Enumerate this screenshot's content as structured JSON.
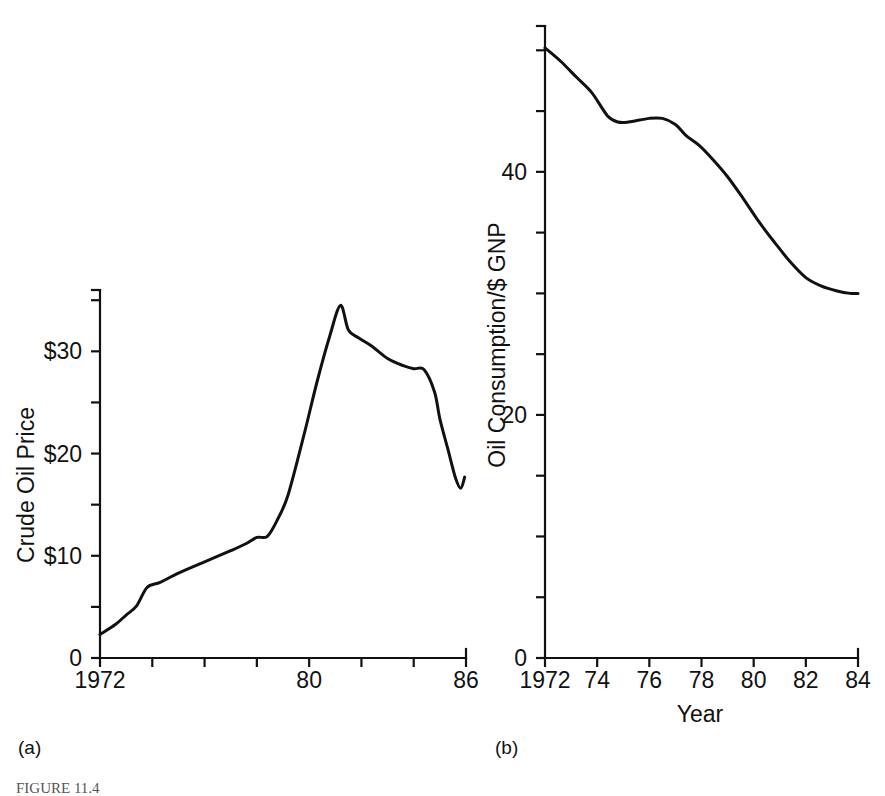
{
  "figure": {
    "caption": "FIGURE 11.4",
    "panel_a_label": "(a)",
    "panel_b_label": "(b)",
    "ink_color": "#111111",
    "background_color": "#ffffff"
  },
  "chart_data": [
    {
      "id": "panel-a",
      "type": "line",
      "title": "",
      "xlabel": "",
      "ylabel": "Crude Oil Price",
      "xlim": [
        1972,
        1986
      ],
      "ylim": [
        0,
        36
      ],
      "grid": false,
      "legend": null,
      "x_tick_values": [
        1972,
        1974,
        1976,
        1978,
        1980,
        1982,
        1984,
        1986
      ],
      "x_tick_labels": [
        "1972",
        "",
        "",
        "",
        "80",
        "",
        "",
        "86"
      ],
      "y_tick_values": [
        0,
        5,
        10,
        15,
        20,
        25,
        30,
        35
      ],
      "y_tick_labels": [
        "0",
        "",
        "$10",
        "",
        "$20",
        "",
        "$30",
        ""
      ],
      "series": [
        {
          "name": "Crude Oil Price",
          "x": [
            1972.0,
            1972.6,
            1973.0,
            1973.4,
            1973.8,
            1974.3,
            1975.0,
            1976.0,
            1977.0,
            1977.6,
            1978.0,
            1978.4,
            1978.8,
            1979.2,
            1979.8,
            1980.3,
            1980.8,
            1981.2,
            1981.5,
            1981.9,
            1982.4,
            1983.0,
            1983.6,
            1984.0,
            1984.4,
            1984.8,
            1985.0,
            1985.3,
            1985.6,
            1985.8,
            1985.95
          ],
          "y": [
            2.3,
            3.3,
            4.2,
            5.1,
            6.9,
            7.4,
            8.3,
            9.4,
            10.5,
            11.2,
            11.8,
            11.9,
            13.6,
            16.0,
            21.8,
            27.0,
            31.6,
            34.5,
            32.1,
            31.3,
            30.5,
            29.3,
            28.6,
            28.3,
            28.2,
            26.0,
            23.4,
            20.5,
            17.6,
            16.6,
            17.7
          ]
        }
      ]
    },
    {
      "id": "panel-b",
      "type": "line",
      "title": "",
      "xlabel": "Year",
      "ylabel": "Oil Consumption/$ GNP",
      "xlim": [
        1972,
        1984
      ],
      "ylim": [
        0,
        52
      ],
      "grid": false,
      "legend": null,
      "x_tick_values": [
        1972,
        1974,
        1976,
        1978,
        1980,
        1982,
        1984
      ],
      "x_tick_labels": [
        "1972",
        "74",
        "76",
        "78",
        "80",
        "82",
        "84"
      ],
      "y_tick_values": [
        0,
        5,
        10,
        15,
        20,
        25,
        30,
        35,
        40,
        45,
        50
      ],
      "y_tick_labels": [
        "0",
        "",
        "",
        "",
        "20",
        "",
        "",
        "",
        "40",
        "",
        ""
      ],
      "series": [
        {
          "name": "Oil Consumption per $ GNP",
          "x": [
            1972.0,
            1972.6,
            1973.2,
            1973.8,
            1974.4,
            1974.8,
            1975.2,
            1976.0,
            1976.5,
            1977.0,
            1977.4,
            1977.9,
            1978.4,
            1979.0,
            1979.6,
            1980.2,
            1980.8,
            1981.4,
            1982.0,
            1982.6,
            1983.2,
            1983.7,
            1984.0
          ],
          "y": [
            50.2,
            49.1,
            47.8,
            46.5,
            44.6,
            44.1,
            44.1,
            44.4,
            44.4,
            43.9,
            43.0,
            42.2,
            41.1,
            39.6,
            37.8,
            35.9,
            34.2,
            32.6,
            31.3,
            30.6,
            30.2,
            30.0,
            30.0
          ]
        }
      ]
    }
  ]
}
